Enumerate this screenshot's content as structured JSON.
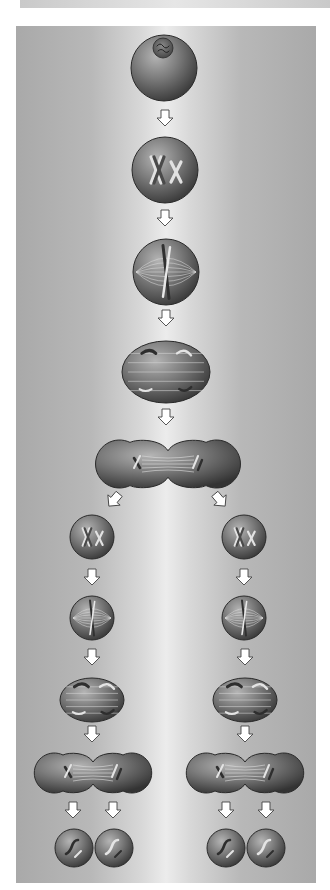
{
  "figure": {
    "colors": {
      "background_edge": "#a9a9a9",
      "background_center": "#ececec",
      "cell_light": "#9a9a9a",
      "cell_dark": "#3a3a3a",
      "arrow_fill": "#ffffff",
      "arrow_stroke": "#444444"
    },
    "stages": [
      {
        "name": "Interphase",
        "shape": "circle",
        "cx": 164,
        "cy": 68,
        "r": 33
      },
      {
        "name": "Prophase I",
        "shape": "circle",
        "cx": 165,
        "cy": 170,
        "r": 33
      },
      {
        "name": "Metaphase I",
        "shape": "circle",
        "cx": 166,
        "cy": 272,
        "r": 33
      },
      {
        "name": "Anaphase I",
        "shape": "ellipse",
        "cx": 166,
        "cy": 372,
        "rx": 44,
        "ry": 31
      },
      {
        "name": "Telophase I",
        "shape": "dumbbell",
        "cx1": 142,
        "cx2": 194,
        "cy": 464,
        "r": 24
      },
      {
        "name": "Prophase II (left)",
        "shape": "circle",
        "cx": 92,
        "cy": 537,
        "r": 22
      },
      {
        "name": "Prophase II (right)",
        "shape": "circle",
        "cx": 244,
        "cy": 537,
        "r": 22
      },
      {
        "name": "Metaphase II (left)",
        "shape": "circle",
        "cx": 92,
        "cy": 618,
        "r": 22
      },
      {
        "name": "Metaphase II (right)",
        "shape": "circle",
        "cx": 244,
        "cy": 618,
        "r": 22
      },
      {
        "name": "Anaphase II (left)",
        "shape": "ellipse",
        "cx": 92,
        "cy": 700,
        "rx": 32,
        "ry": 22
      },
      {
        "name": "Anaphase II (right)",
        "shape": "ellipse",
        "cx": 245,
        "cy": 700,
        "rx": 32,
        "ry": 22
      },
      {
        "name": "Telophase II (left)",
        "shape": "dumbbell",
        "cx1": 73,
        "cx2": 113,
        "cy": 773,
        "r": 20
      },
      {
        "name": "Telophase II (right)",
        "shape": "dumbbell",
        "cx1": 225,
        "cx2": 265,
        "cy": 773,
        "r": 20
      },
      {
        "name": "Daughter cell 1",
        "shape": "circle",
        "cx": 74,
        "cy": 848,
        "r": 19
      },
      {
        "name": "Daughter cell 2",
        "shape": "circle",
        "cx": 114,
        "cy": 848,
        "r": 19
      },
      {
        "name": "Daughter cell 3",
        "shape": "circle",
        "cx": 226,
        "cy": 848,
        "r": 19
      },
      {
        "name": "Daughter cell 4",
        "shape": "circle",
        "cx": 266,
        "cy": 848,
        "r": 19
      }
    ],
    "arrows": [
      {
        "x": 165,
        "y": 118,
        "dir": "down"
      },
      {
        "x": 165,
        "y": 218,
        "dir": "down"
      },
      {
        "x": 166,
        "y": 318,
        "dir": "down"
      },
      {
        "x": 166,
        "y": 417,
        "dir": "down"
      },
      {
        "x": 114,
        "y": 500,
        "dir": "down-left"
      },
      {
        "x": 220,
        "y": 500,
        "dir": "down-right"
      },
      {
        "x": 92,
        "y": 577,
        "dir": "down"
      },
      {
        "x": 244,
        "y": 577,
        "dir": "down"
      },
      {
        "x": 92,
        "y": 657,
        "dir": "down"
      },
      {
        "x": 245,
        "y": 657,
        "dir": "down"
      },
      {
        "x": 92,
        "y": 734,
        "dir": "down"
      },
      {
        "x": 245,
        "y": 734,
        "dir": "down"
      },
      {
        "x": 73,
        "y": 810,
        "dir": "down"
      },
      {
        "x": 113,
        "y": 810,
        "dir": "down"
      },
      {
        "x": 226,
        "y": 810,
        "dir": "down"
      },
      {
        "x": 266,
        "y": 810,
        "dir": "down"
      }
    ]
  }
}
